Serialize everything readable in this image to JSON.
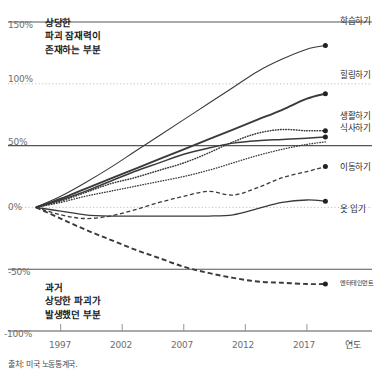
{
  "chart_data": {
    "type": "line",
    "title": "",
    "xlabel": "연도",
    "ylabel": "",
    "xlim": [
      1995,
      2019.2
    ],
    "ylim": [
      -100,
      160
    ],
    "grid": true,
    "legend_position": "right-endpoints",
    "x_ticks": [
      "1997",
      "2002",
      "2007",
      "2012",
      "2017"
    ],
    "x_tick_values": [
      1997,
      2002,
      2007,
      2012,
      2017
    ],
    "y_ticks": [
      "150%",
      "100%",
      "50%",
      "0%",
      "-50%",
      "-100%"
    ],
    "y_tick_values": [
      150,
      100,
      50,
      0,
      -50,
      -100
    ],
    "x": [
      1995,
      1997,
      1999,
      2001,
      2003,
      2005,
      2007,
      2009,
      2011,
      2013,
      2015,
      2017,
      2018.5
    ],
    "series": [
      {
        "name": "학습하기",
        "style": "solid",
        "width": 1.1,
        "values": [
          0,
          9,
          20,
          32,
          45,
          58,
          71,
          84,
          97,
          110,
          120,
          128,
          131
        ]
      },
      {
        "name": "힐링하기",
        "style": "solid",
        "width": 1.9,
        "values": [
          0,
          7,
          15,
          23,
          31,
          39,
          47,
          55,
          63,
          71,
          79,
          88,
          92
        ]
      },
      {
        "name": "생활하기",
        "style": "dotted",
        "width": 1.5,
        "values": [
          0,
          5,
          12,
          19,
          24,
          30,
          36,
          44,
          53,
          60,
          63,
          62,
          62
        ]
      },
      {
        "name": "식사하기",
        "style": "solid",
        "width": 1.5,
        "values": [
          0,
          6,
          13,
          21,
          29,
          36,
          43,
          48,
          52,
          54,
          55,
          56,
          57
        ]
      },
      {
        "name": "이동하기",
        "style": "dotted",
        "width": 1.3,
        "values": [
          0,
          4,
          9,
          13,
          17,
          21,
          25,
          30,
          36,
          42,
          47,
          51,
          53
        ]
      },
      {
        "name": "이동하기-dash",
        "style": "dashed",
        "width": 1.3,
        "values": [
          0,
          -6,
          -9,
          -7,
          -2,
          4,
          9,
          13,
          10,
          16,
          24,
          29,
          33
        ]
      },
      {
        "name": "옷 입기",
        "style": "solid",
        "width": 1.3,
        "values": [
          0,
          -3,
          -6,
          -7,
          -7,
          -7,
          -7,
          -7,
          -6,
          -1,
          4,
          6,
          5
        ]
      },
      {
        "name": "엔터테인먼트",
        "style": "dashed-bold",
        "width": 1.9,
        "values": [
          0,
          -9,
          -18,
          -26,
          -34,
          -41,
          -48,
          -53,
          -57,
          -60,
          -61,
          -62,
          -62
        ]
      }
    ],
    "endpoint_labels": [
      {
        "name": "학습하기",
        "value": 131
      },
      {
        "name": "힐링하기",
        "value": 92
      },
      {
        "name": "생활하기",
        "value": 62
      },
      {
        "name": "식사하기",
        "value": 57
      },
      {
        "name": "이동하기",
        "value": 33
      },
      {
        "name": "옷 입기",
        "value": 5
      },
      {
        "name": "엔터테인먼트",
        "value": -62
      }
    ],
    "annotations": [
      {
        "id": "upper",
        "lines": [
          "상당한",
          "파괴 잠재력이",
          "존재하는 부분"
        ]
      },
      {
        "id": "lower",
        "lines": [
          "과거",
          "상당한 파괴가",
          "발생했던 부분"
        ]
      }
    ]
  },
  "axis": {
    "y_tick_150": "150%",
    "y_tick_100": "100%",
    "y_tick_50": "50%",
    "y_tick_0": "0%",
    "y_tick_neg50": "-50%",
    "y_tick_neg100": "-100%",
    "x_tick_1997": "1997",
    "x_tick_2002": "2002",
    "x_tick_2007": "2007",
    "x_tick_2012": "2012",
    "x_tick_2017": "2017",
    "x_axis_title": "연도"
  },
  "annotations": {
    "upper_line1": "상당한",
    "upper_line2": "파괴 잠재력이",
    "upper_line3": "존재하는 부분",
    "lower_line1": "과거",
    "lower_line2": "상당한 파괴가",
    "lower_line3": "발생했던 부분"
  },
  "series_labels": {
    "learning": "학습하기",
    "healing": "힐링하기",
    "living": "생활하기",
    "eating": "식사하기",
    "moving": "이동하기",
    "clothing": "옷 입기",
    "entertainment": "엔터테인먼트"
  },
  "footer": {
    "source": "출처: 미국 노동통계국."
  },
  "colors": {
    "line": "#3a3a3a",
    "grid_solid": "#555555",
    "grid_dotted": "#b9b9b9",
    "text": "#231f20",
    "tick_text": "#6e6e6e",
    "background": "#ffffff"
  }
}
